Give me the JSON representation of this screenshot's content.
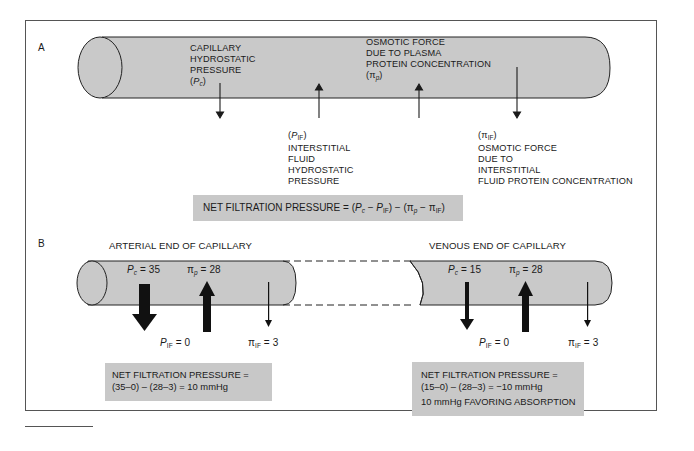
{
  "panel_a": {
    "label": "A",
    "capillary_hydrostatic": {
      "lines": [
        "CAPILLARY",
        "HYDROSTATIC",
        "PRESSURE"
      ],
      "symbol": "P",
      "sub": "c"
    },
    "plasma_osmotic": {
      "lines": [
        "OSMOTIC FORCE",
        "DUE TO PLASMA",
        "PROTEIN CONCENTRATION"
      ],
      "symbol": "π",
      "sub": "p"
    },
    "interstitial_hydrostatic": {
      "symbol": "P",
      "sub": "IF",
      "lines": [
        "INTERSTITIAL",
        "FLUID",
        "HYDROSTATIC",
        "PRESSURE"
      ]
    },
    "interstitial_osmotic": {
      "symbol": "π",
      "sub": "IF",
      "lines": [
        "OSMOTIC FORCE",
        "DUE TO",
        "INTERSTITIAL",
        "FLUID PROTEIN CONCENTRATION"
      ]
    },
    "formula": {
      "prefix": "NET FILTRATION PRESSURE = (",
      "p": "P",
      "pc_sub": "c",
      "minus1": " − ",
      "pif_sub": "IF",
      "mid": ") − (",
      "pi": "π",
      "pip_sub": "p",
      "minus2": " − ",
      "piif_sub": "IF",
      "suffix": ")"
    }
  },
  "panel_b": {
    "label": "B",
    "arterial": {
      "title": "ARTERIAL END OF CAPILLARY",
      "pc": {
        "symbol": "P",
        "sub": "c",
        "value": " = 35"
      },
      "pip": {
        "symbol": "π",
        "sub": "p",
        "value": " = 28"
      },
      "pif": {
        "symbol": "P",
        "sub": "IF",
        "value": " = 0"
      },
      "piif": {
        "symbol": "π",
        "sub": "IF",
        "value": " = 3"
      },
      "result_lines": [
        "NET FILTRATION PRESSURE =",
        "(35–0) – (28–3) = 10 mmHg"
      ]
    },
    "venous": {
      "title": "VENOUS END OF CAPILLARY",
      "pc": {
        "symbol": "P",
        "sub": "c",
        "value": " = 15"
      },
      "pip": {
        "symbol": "π",
        "sub": "p",
        "value": " = 28"
      },
      "pif": {
        "symbol": "P",
        "sub": "IF",
        "value": " = 0"
      },
      "piif": {
        "symbol": "π",
        "sub": "IF",
        "value": " = 3"
      },
      "result_lines": [
        "NET FILTRATION PRESSURE =",
        "(15–0) – (28–3) = −10 mmHg",
        "10 mmHg FAVORING ABSORPTION"
      ]
    }
  },
  "colors": {
    "vessel_fill": "#c9c9c9",
    "box_fill": "#c8c8c8",
    "stroke": "#222222"
  }
}
